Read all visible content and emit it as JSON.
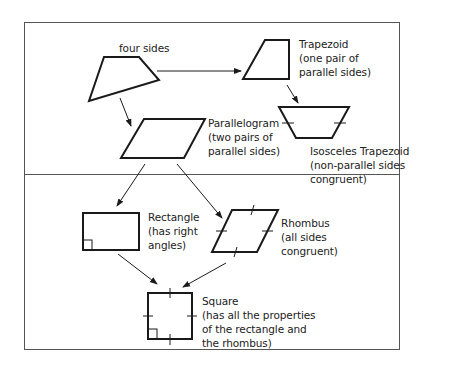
{
  "diagram": {
    "nodes": {
      "quadrilateral": {
        "label": "four sides"
      },
      "trapezoid": {
        "name": "Trapezoid",
        "desc1": "(one pair of",
        "desc2": "parallel sides)"
      },
      "isosceles_trapezoid": {
        "name": "Isosceles Trapezoid",
        "desc1": "(non-parallel sides",
        "desc2": "congruent)"
      },
      "parallelogram": {
        "name": "Parallelogram",
        "desc1": "(two pairs of",
        "desc2": "parallel sides)"
      },
      "rectangle": {
        "name": "Rectangle",
        "desc1": "(has right",
        "desc2": "angles)"
      },
      "rhombus": {
        "name": "Rhombus",
        "desc1": "(all sides",
        "desc2": "congruent)"
      },
      "square": {
        "name": "Square",
        "desc1": "(has all the properties",
        "desc2": "of the rectangle and",
        "desc3": "the rhombus)"
      }
    },
    "edges": [
      {
        "from": "quadrilateral",
        "to": "trapezoid"
      },
      {
        "from": "quadrilateral",
        "to": "parallelogram"
      },
      {
        "from": "trapezoid",
        "to": "isosceles_trapezoid"
      },
      {
        "from": "parallelogram",
        "to": "rectangle"
      },
      {
        "from": "parallelogram",
        "to": "rhombus"
      },
      {
        "from": "rectangle",
        "to": "square"
      },
      {
        "from": "rhombus",
        "to": "square"
      }
    ],
    "colors": {
      "stroke": "#1a1a1a",
      "frame": "#555555",
      "text": "#222222"
    }
  }
}
